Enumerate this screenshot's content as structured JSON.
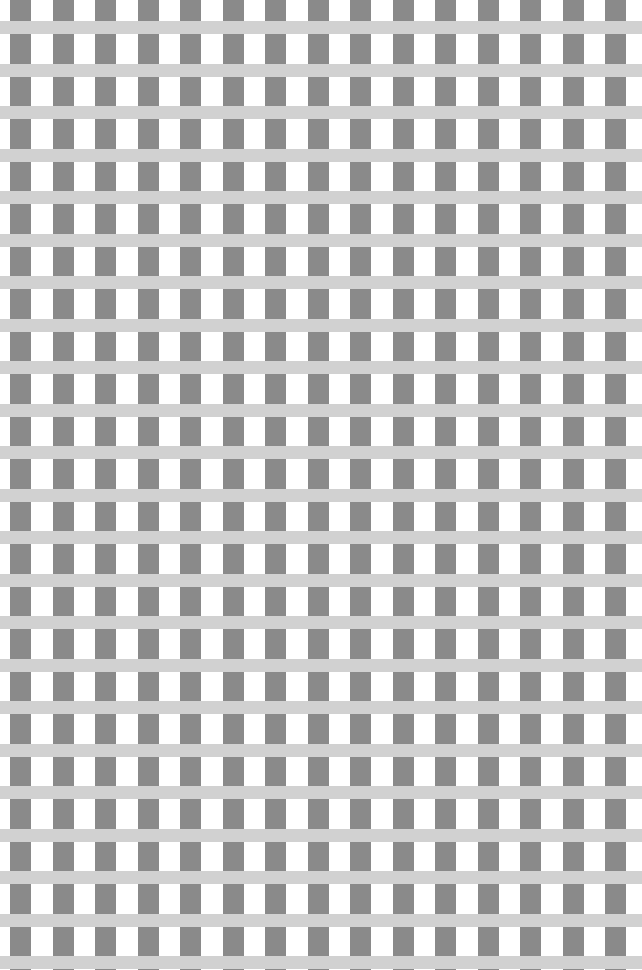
{
  "image": {
    "kind": "visual-pattern",
    "name": "scintillating-grid-pattern",
    "width": 642,
    "height": 970,
    "background_color": "#ffffff"
  },
  "chart_data": {
    "type": "heatmap",
    "title": "",
    "xlabel": "",
    "ylabel": "",
    "grid": true,
    "legend_position": "none",
    "palette": {
      "white": "#ffffff",
      "light_gray_band": "#d1d1d1",
      "dark_gray_square": "#8a8a8a"
    },
    "geometry": {
      "period_x": 42.5,
      "period_y": 42.5,
      "column_width": 21,
      "column_offset_x": 10,
      "band_height": 13,
      "band_offset_y": 21,
      "column_count": 16,
      "band_count": 24
    },
    "categories": [
      "col-0",
      "col-1",
      "col-2",
      "col-3",
      "col-4",
      "col-5",
      "col-6",
      "col-7",
      "col-8",
      "col-9",
      "col-10",
      "col-11",
      "col-12",
      "col-13",
      "col-14",
      "col-15"
    ],
    "series": [
      {
        "name": "dark-gray-column",
        "values": [
          1,
          1,
          1,
          1,
          1,
          1,
          1,
          1,
          1,
          1,
          1,
          1,
          1,
          1,
          1,
          1
        ]
      },
      {
        "name": "white-gap",
        "values": [
          0,
          0,
          0,
          0,
          0,
          0,
          0,
          0,
          0,
          0,
          0,
          0,
          0,
          0,
          0,
          0
        ]
      }
    ]
  }
}
